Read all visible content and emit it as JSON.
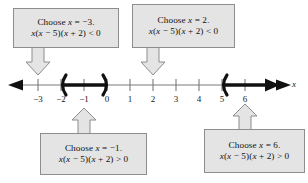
{
  "figure": {
    "type": "number-line-sign-chart",
    "axis_variable": "x"
  },
  "callouts": [
    {
      "id": "top-left",
      "choose_line": "Choose x = −3.",
      "test_line": "x(x − 5)(x + 2) < 0",
      "points_to": "-3",
      "arrow_direction": "down"
    },
    {
      "id": "top-right",
      "choose_line": "Choose x = 2.",
      "test_line": "x(x − 5)(x + 2) < 0",
      "points_to": "2",
      "arrow_direction": "down"
    },
    {
      "id": "bottom-left",
      "choose_line": "Choose x = −1.",
      "test_line": "x(x − 5)(x + 2) > 0",
      "points_to": "-1",
      "arrow_direction": "up"
    },
    {
      "id": "bottom-right",
      "choose_line": "Choose x = 6.",
      "test_line": "x(x − 5)(x + 2) > 0",
      "points_to": "6",
      "arrow_direction": "up"
    }
  ],
  "chart_data": {
    "type": "line",
    "title": "",
    "xlabel": "x",
    "ylabel": "",
    "xlim": [
      -3.8,
      6.9
    ],
    "grid": false,
    "legend": "none",
    "tick_labels": [
      "−3",
      "−2",
      "−1",
      "0",
      "1",
      "2",
      "3",
      "4",
      "5",
      "6"
    ],
    "tick_values": [
      -3,
      -2,
      -1,
      0,
      1,
      2,
      3,
      4,
      5,
      6
    ],
    "axis_arrows": [
      "left",
      "right"
    ],
    "intervals": [
      {
        "label": "(−2, 0)",
        "start": -2,
        "end": 0,
        "start_endpoint": "open",
        "end_endpoint": "open",
        "style": "bold-segment",
        "color": "#111111"
      },
      {
        "label": "(5, ∞)",
        "start": 5,
        "end": "infinity",
        "start_endpoint": "open",
        "end_endpoint": "arrow",
        "style": "bold-ray",
        "color": "#111111"
      }
    ],
    "test_points": [
      -3,
      -1,
      2,
      6
    ],
    "annotations": [
      "Choose x = −3.  x(x − 5)(x + 2) < 0",
      "Choose x = 2.  x(x − 5)(x + 2) < 0",
      "Choose x = −1.  x(x − 5)(x + 2) > 0",
      "Choose x = 6.  x(x − 5)(x + 2) > 0"
    ]
  },
  "colors": {
    "box_fill": "#e4e4e4",
    "box_border": "#8d8d8d",
    "axis": "#6f6f6f",
    "interval": "#111111",
    "text": "#111111"
  }
}
